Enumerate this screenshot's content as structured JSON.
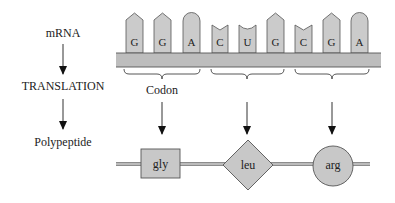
{
  "left_flow": {
    "step1": "mRNA",
    "step2": "TRANSLATION",
    "step3": "Polypeptide"
  },
  "mrna": {
    "bases": [
      {
        "letter": "G",
        "shape": "point",
        "x": 126
      },
      {
        "letter": "G",
        "shape": "point",
        "x": 154
      },
      {
        "letter": "A",
        "shape": "round",
        "x": 183
      },
      {
        "letter": "C",
        "shape": "notch",
        "x": 212
      },
      {
        "letter": "U",
        "shape": "cup",
        "x": 239
      },
      {
        "letter": "G",
        "shape": "point",
        "x": 267
      },
      {
        "letter": "C",
        "shape": "notch",
        "x": 295
      },
      {
        "letter": "G",
        "shape": "point",
        "x": 323
      },
      {
        "letter": "A",
        "shape": "round",
        "x": 351
      }
    ]
  },
  "codon_label": "Codon",
  "polypeptide": {
    "residues": [
      {
        "label": "gly",
        "shape": "square"
      },
      {
        "label": "leu",
        "shape": "diamond"
      },
      {
        "label": "arg",
        "shape": "circle"
      }
    ]
  },
  "colors": {
    "fill": "#c8c8c8",
    "stroke": "#555555",
    "backbone": "#bdbdbd",
    "text": "#222222"
  }
}
